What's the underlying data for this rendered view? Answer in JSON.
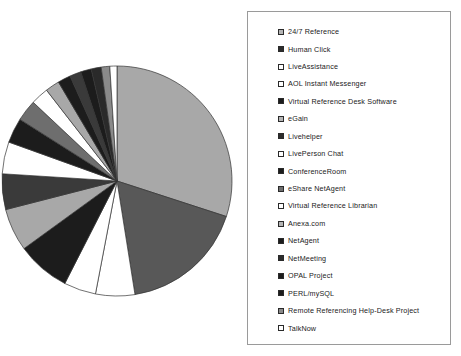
{
  "chart_data": {
    "type": "pie",
    "title": "",
    "start_angle_deg": 0,
    "direction": "clockwise",
    "legend_position": "right",
    "grid": false,
    "center": {
      "x": 117,
      "y": 181
    },
    "radius": 115,
    "categories": [
      "24/7 Reference",
      "Human Click",
      "LiveAssistance",
      "AOL Instant Messenger",
      "Virtual Reference Desk Software",
      "eGain",
      "Livehelper",
      "LivePerson Chat",
      "ConferenceRoom",
      "eShare NetAgent",
      "Virtual Reference Librarian",
      "Anexa.com",
      "NetAgent",
      "NetMeeting",
      "OPAL Project",
      "PERL/mySQL",
      "Remote Referencing Help-Desk Project",
      "TalkNow"
    ],
    "values": [
      30.0,
      17.5,
      5.5,
      4.5,
      7.5,
      6.0,
      5.0,
      4.5,
      3.5,
      3.0,
      2.5,
      2.0,
      1.8,
      1.6,
      1.5,
      1.4,
      1.2,
      1.0
    ],
    "colors": [
      "#a8a8a8",
      "#585858",
      "#ffffff",
      "#ffffff",
      "#1c1c1c",
      "#a8a8a8",
      "#3a3a3a",
      "#ffffff",
      "#1c1c1c",
      "#6e6e6e",
      "#ffffff",
      "#a8a8a8",
      "#1c1c1c",
      "#3a3a3a",
      "#1c1c1c",
      "#2a2a2a",
      "#8a8a8a",
      "#ffffff"
    ],
    "xlabel": "",
    "ylabel": ""
  },
  "legend": {
    "items": [
      {
        "label": "24/7 Reference",
        "swatch": "#b5b5b5"
      },
      {
        "label": "Human Click",
        "swatch": "#2c2c2c"
      },
      {
        "label": "LiveAssistance",
        "swatch": "#ffffff"
      },
      {
        "label": "AOL Instant Messenger",
        "swatch": "#ffffff"
      },
      {
        "label": "Virtual Reference Desk Software",
        "swatch": "#1c1c1c"
      },
      {
        "label": "eGain",
        "swatch": "#b5b5b5"
      },
      {
        "label": "Livehelper",
        "swatch": "#2c2c2c"
      },
      {
        "label": "LivePerson Chat",
        "swatch": "#ffffff"
      },
      {
        "label": "ConferenceRoom",
        "swatch": "#1c1c1c"
      },
      {
        "label": "eShare NetAgent",
        "swatch": "#6e6e6e"
      },
      {
        "label": "Virtual Reference Librarian",
        "swatch": "#ffffff"
      },
      {
        "label": "Anexa.com",
        "swatch": "#b5b5b5"
      },
      {
        "label": "NetAgent",
        "swatch": "#1c1c1c"
      },
      {
        "label": "NetMeeting",
        "swatch": "#2c2c2c"
      },
      {
        "label": "OPAL Project",
        "swatch": "#1c1c1c"
      },
      {
        "label": "PERL/mySQL",
        "swatch": "#1c1c1c"
      },
      {
        "label": "Remote Referencing Help-Desk Project",
        "swatch": "#8a8a8a"
      },
      {
        "label": "TalkNow",
        "swatch": "#ffffff"
      }
    ]
  }
}
